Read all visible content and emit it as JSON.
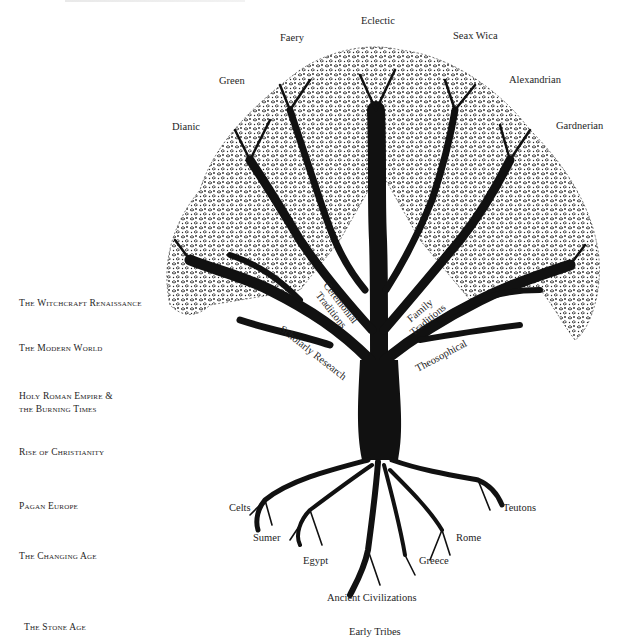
{
  "diagram": {
    "type": "tree",
    "canopy_traditions": [
      {
        "id": "eclectic",
        "label": "Eclectic"
      },
      {
        "id": "faery",
        "label": "Faery"
      },
      {
        "id": "seax-wica",
        "label": "Seax Wica"
      },
      {
        "id": "green",
        "label": "Green"
      },
      {
        "id": "alexandrian",
        "label": "Alexandrian"
      },
      {
        "id": "dianic",
        "label": "Dianic"
      },
      {
        "id": "gardnerian",
        "label": "Gardnerian"
      }
    ],
    "limb_labels": [
      {
        "id": "ceremonial",
        "line1": "Ceremonial",
        "line2": "Traditions"
      },
      {
        "id": "family",
        "line1": "Family",
        "line2": "Traditions"
      },
      {
        "id": "scholarly",
        "line1": "Scholarly Research"
      },
      {
        "id": "theosophical",
        "line1": "Theosophical"
      }
    ],
    "root_labels": [
      {
        "id": "celts",
        "label": "Celts"
      },
      {
        "id": "teutons",
        "label": "Teutons"
      },
      {
        "id": "sumer",
        "label": "Sumer"
      },
      {
        "id": "rome",
        "label": "Rome"
      },
      {
        "id": "egypt",
        "label": "Egypt"
      },
      {
        "id": "greece",
        "label": "Greece"
      },
      {
        "id": "ancient-civilizations",
        "label": "Ancient Civilizations"
      },
      {
        "id": "early-tribes",
        "label": "Early Tribes"
      }
    ],
    "timeline_eras": [
      {
        "id": "witchcraft-renaissance",
        "line1": "The Witchcraft Renaissance"
      },
      {
        "id": "modern-world",
        "line1": "The Modern World"
      },
      {
        "id": "holy-roman-empire",
        "line1": "Holy Roman Empire &",
        "line2": "the Burning Times"
      },
      {
        "id": "rise-of-christianity",
        "line1": "Rise of Christianity"
      },
      {
        "id": "pagan-europe",
        "line1": "Pagan Europe"
      },
      {
        "id": "changing-age",
        "line1": "The Changing Age"
      },
      {
        "id": "stone-age",
        "line1": "The Stone Age"
      }
    ],
    "colors": {
      "ink": "#111111",
      "text": "#1e1e1e",
      "background": "#ffffff"
    }
  }
}
